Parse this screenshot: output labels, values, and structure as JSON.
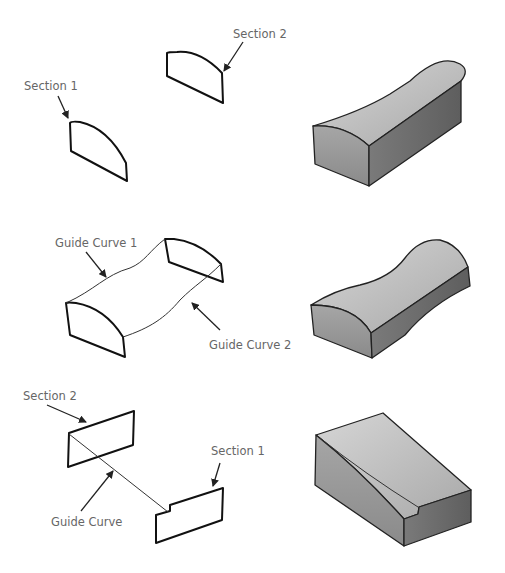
{
  "figure": {
    "rows": [
      {
        "name": "loft-two-sections",
        "labels": {
          "section_1": "Section 1",
          "section_2": "Section 2"
        }
      },
      {
        "name": "loft-with-guide-curves",
        "labels": {
          "guide_curve_1": "Guide Curve 1",
          "guide_curve_2": "Guide Curve 2"
        }
      },
      {
        "name": "loft-with-single-guide-curve",
        "labels": {
          "section_2": "Section 2",
          "section_1": "Section 1",
          "guide_curve": "Guide Curve"
        }
      }
    ],
    "colors": {
      "background": "#ffffff",
      "line": "#111111",
      "label_text": "#666666",
      "solid_light": "#c8c8c8",
      "solid_mid": "#9a9a9a",
      "solid_dark": "#6e6e6e"
    }
  }
}
